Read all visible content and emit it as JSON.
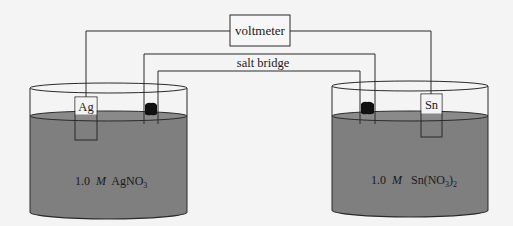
{
  "diagram": {
    "voltmeter": {
      "label": "voltmeter"
    },
    "salt_bridge": {
      "label": "salt bridge"
    },
    "left_cell": {
      "electrode": "Ag",
      "solution": {
        "conc": "1.0",
        "unit": "M",
        "formula": "AgNO",
        "sub": "3",
        "suffix": ""
      }
    },
    "right_cell": {
      "electrode": "Sn",
      "solution": {
        "conc": "1.0",
        "unit": "M",
        "formula": "Sn(NO",
        "sub": "3",
        "suffix": ")",
        "sub2": "2"
      }
    },
    "colors": {
      "solution": "#7f7f7f",
      "line": "#2a2a2a",
      "plug": "#111111",
      "background": "#f4f4f4"
    }
  }
}
